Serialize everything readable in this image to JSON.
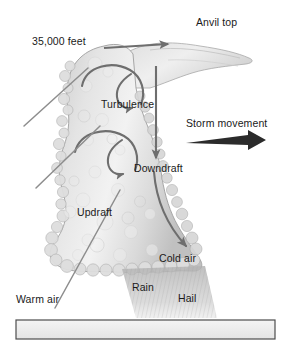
{
  "figure": {
    "width": 293,
    "height": 353,
    "background_color": "#ffffff"
  },
  "labels": {
    "altitude": "35,000 feet",
    "anvil_top": "Anvil top",
    "turbulence": "Turbulence",
    "storm_movement": "Storm movement",
    "downdraft": "Downdraft",
    "updraft": "Updraft",
    "cold_air": "Cold air",
    "rain": "Rain",
    "hail": "Hail",
    "warm_air": "Warm air"
  },
  "colors": {
    "text": "#1a1a1a",
    "cloud_fill": "#dcdcdc",
    "cloud_edge": "#9a9a9a",
    "arrow_gray": "#6e6e6e",
    "arrow_dark": "#2b2b2b",
    "ground_fill": "#eeeeee",
    "ground_edge": "#555555",
    "precip": "#b8b8b8"
  },
  "elements": {
    "cloud_body": "cumulonimbus-cloud",
    "anvil": "anvil-top-spread",
    "anvil_arrow": "anvil-outflow-arrow",
    "turbulence_eddy_upper": "upper-turbulence-circulation",
    "turbulence_eddy_lower": "lower-turbulence-circulation",
    "downdraft_arrow_upper": "downdraft-arrow-upper",
    "downdraft_arrow_lower": "downdraft-arrow-lower",
    "updraft_lines": "warm-air-inflow-lines",
    "storm_movement_arrow": "storm-movement-arrow",
    "precipitation_shaft": "rain-and-hail-shaft",
    "ground_bar": "ground-surface-bar"
  }
}
